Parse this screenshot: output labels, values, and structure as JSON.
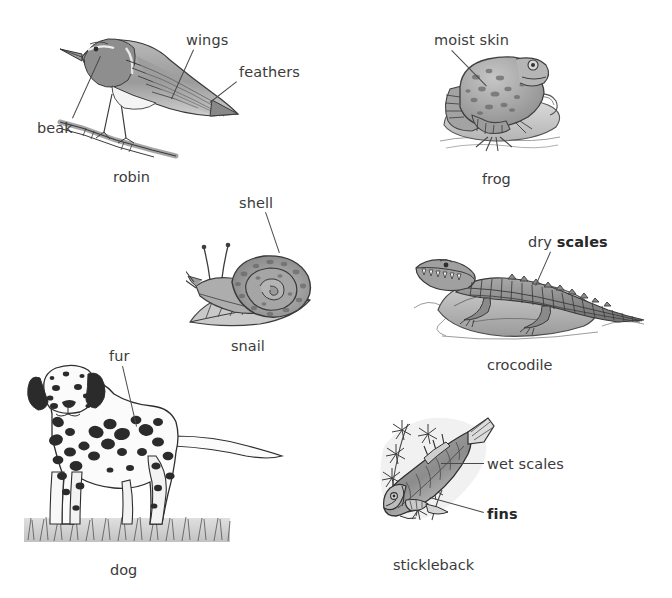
{
  "page": {
    "background": "#ffffff",
    "ink": "#3b3b3b",
    "leader_color": "#4a4a4a",
    "width": 672,
    "height": 598
  },
  "figures": [
    {
      "id": "robin",
      "name": "robin",
      "name_pos": {
        "x": 113,
        "y": 170
      },
      "drawing": {
        "x": 52,
        "y": 30,
        "w": 190,
        "h": 130
      },
      "labels": [
        {
          "key": "beak",
          "text": "beak",
          "bold": false,
          "x": 37,
          "y": 121,
          "leader": {
            "x1": 72,
            "y1": 118,
            "x2": 100,
            "y2": 56
          }
        },
        {
          "key": "wings",
          "text": "wings",
          "bold": false,
          "x": 186,
          "y": 33,
          "leader": {
            "x1": 194,
            "y1": 50,
            "x2": 172,
            "y2": 99
          }
        },
        {
          "key": "feathers",
          "text": "feathers",
          "bold": false,
          "x": 239,
          "y": 65,
          "leader": {
            "x1": 237,
            "y1": 82,
            "x2": 210,
            "y2": 103
          }
        }
      ]
    },
    {
      "id": "frog",
      "name": "frog",
      "name_pos": {
        "x": 482,
        "y": 172
      },
      "drawing": {
        "x": 432,
        "y": 45,
        "w": 140,
        "h": 115
      },
      "labels": [
        {
          "key": "moist-skin",
          "text": "moist skin",
          "bold": false,
          "x": 434,
          "y": 33,
          "leader": {
            "x1": 452,
            "y1": 50,
            "x2": 487,
            "y2": 86
          }
        }
      ]
    },
    {
      "id": "snail",
      "name": "snail",
      "name_pos": {
        "x": 231,
        "y": 339
      },
      "drawing": {
        "x": 186,
        "y": 238,
        "w": 145,
        "h": 95
      },
      "labels": [
        {
          "key": "shell",
          "text": "shell",
          "bold": false,
          "x": 239,
          "y": 196,
          "leader": {
            "x1": 266,
            "y1": 212,
            "x2": 280,
            "y2": 253
          }
        }
      ]
    },
    {
      "id": "crocodile",
      "name": "crocodile",
      "name_pos": {
        "x": 487,
        "y": 358
      },
      "drawing": {
        "x": 412,
        "y": 248,
        "w": 235,
        "h": 95
      },
      "labels": [
        {
          "key": "dry-scales",
          "text_prefix": "dry ",
          "text_bold": "scales",
          "bold": true,
          "x": 528,
          "y": 235,
          "leader": {
            "x1": 551,
            "y1": 252,
            "x2": 536,
            "y2": 286
          }
        }
      ]
    },
    {
      "id": "dog",
      "name": "dog",
      "name_pos": {
        "x": 110,
        "y": 563
      },
      "drawing": {
        "x": 18,
        "y": 360,
        "w": 272,
        "h": 190
      },
      "labels": [
        {
          "key": "fur",
          "text": "fur",
          "bold": false,
          "x": 109,
          "y": 349,
          "leader": {
            "x1": 123,
            "y1": 366,
            "x2": 137,
            "y2": 426
          }
        }
      ]
    },
    {
      "id": "stickleback",
      "name": "stickleback",
      "name_pos": {
        "x": 393,
        "y": 558
      },
      "drawing": {
        "x": 372,
        "y": 412,
        "w": 130,
        "h": 125
      },
      "labels": [
        {
          "key": "wet-scales",
          "text": "wet scales",
          "bold": false,
          "x": 487,
          "y": 457,
          "leader": {
            "x1": 484,
            "y1": 463,
            "x2": 441,
            "y2": 463
          }
        },
        {
          "key": "fins",
          "text": "fins",
          "bold": true,
          "x": 487,
          "y": 507,
          "leader": {
            "x1": 484,
            "y1": 512,
            "x2": 430,
            "y2": 497
          }
        }
      ]
    }
  ]
}
